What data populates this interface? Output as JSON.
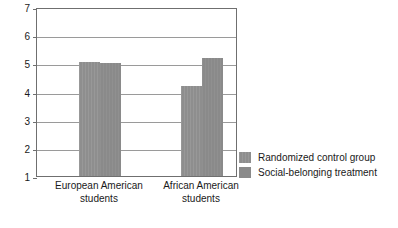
{
  "chart_data": {
    "type": "bar",
    "title": "",
    "xlabel": "",
    "ylabel": "Subjective happiness",
    "ylim": [
      1,
      7
    ],
    "yticks": [
      "7",
      "6",
      "5",
      "4",
      "3",
      "2",
      "1"
    ],
    "grid": true,
    "legend_position": "right",
    "categories": [
      "European American\nstudents",
      "African American\nstudents"
    ],
    "category_lines": [
      [
        "European American",
        "students"
      ],
      [
        "African American",
        "students"
      ]
    ],
    "series": [
      {
        "name": "Randomized control group",
        "color": "#8e8e8e",
        "values": [
          5.05,
          4.2
        ]
      },
      {
        "name": "Social-belonging treatment",
        "color": "#8a8a8a",
        "values": [
          5.0,
          5.2
        ]
      }
    ]
  },
  "axis": {
    "y_title": "Subjective happiness",
    "y_tick_labels": [
      "7",
      "6",
      "5",
      "4",
      "3",
      "2",
      "1"
    ]
  },
  "legend": {
    "entries": [
      {
        "label": "Randomized control group"
      },
      {
        "label": "Social-belonging treatment"
      }
    ]
  },
  "categories": [
    {
      "line1": "European American",
      "line2": "students"
    },
    {
      "line1": "African American",
      "line2": "students"
    }
  ]
}
